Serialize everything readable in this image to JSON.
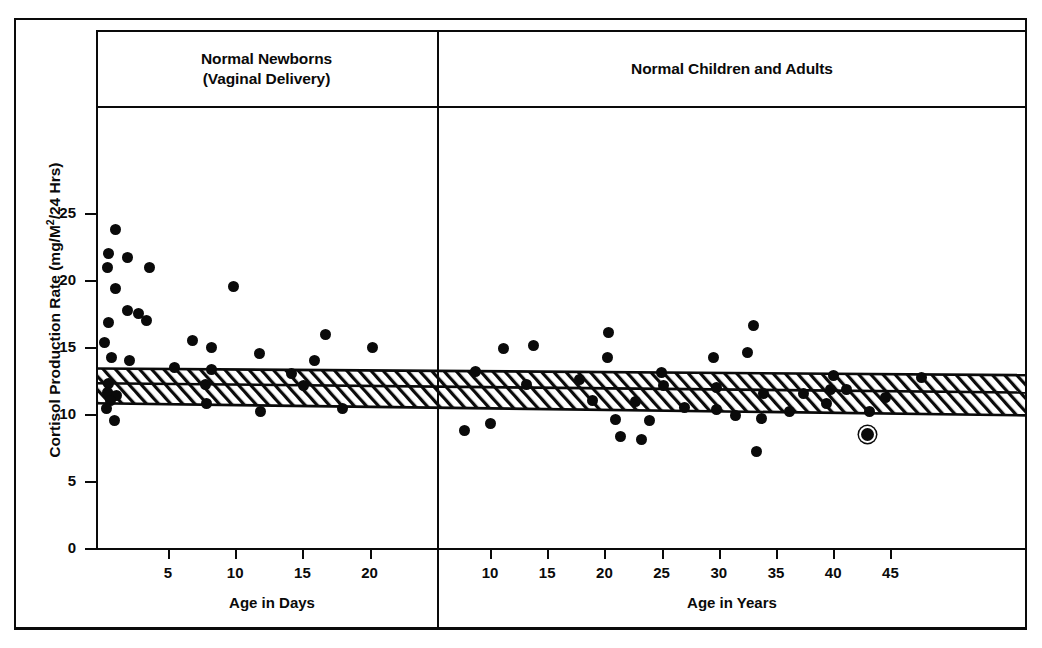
{
  "figure": {
    "y_axis_title_main": "Cortisol Production Rate (mg/M",
    "y_axis_title_sup": "2",
    "y_axis_title_tail": "/24 Hrs)"
  },
  "panels": {
    "left": {
      "title_line1": "Normal Newborns",
      "title_line2": "(Vaginal Delivery)",
      "x_axis_label": "Age in Days",
      "x_ticks": [
        5,
        10,
        15,
        20
      ]
    },
    "right": {
      "title": "Normal Children and Adults",
      "x_axis_label": "Age in Years",
      "x_ticks": [
        10,
        15,
        20,
        25,
        30,
        35,
        40,
        45
      ]
    }
  },
  "chart_data": {
    "type": "scatter",
    "ylabel": "Cortisol Production Rate (mg/M2/24 Hrs)",
    "ylim": [
      0,
      28
    ],
    "yticks": [
      0,
      5,
      10,
      15,
      20,
      25
    ],
    "grid": false,
    "legend": "none",
    "marker_color": "#0a0a0a",
    "panels": [
      {
        "name": "Normal Newborns (Vaginal Delivery)",
        "xlabel": "Age in Days",
        "xlim": [
          0,
          24
        ],
        "xticks": [
          5,
          10,
          15,
          20
        ],
        "points": [
          {
            "x": 1.1,
            "y": 23.8
          },
          {
            "x": 0.6,
            "y": 22.0
          },
          {
            "x": 0.5,
            "y": 20.9
          },
          {
            "x": 2.0,
            "y": 21.7
          },
          {
            "x": 3.6,
            "y": 20.9
          },
          {
            "x": 1.1,
            "y": 19.4
          },
          {
            "x": 9.9,
            "y": 19.5
          },
          {
            "x": 2.0,
            "y": 17.7
          },
          {
            "x": 2.8,
            "y": 17.5
          },
          {
            "x": 0.6,
            "y": 16.8
          },
          {
            "x": 3.4,
            "y": 17.0
          },
          {
            "x": 0.3,
            "y": 15.3
          },
          {
            "x": 6.8,
            "y": 15.5
          },
          {
            "x": 8.2,
            "y": 15.0
          },
          {
            "x": 16.7,
            "y": 15.9
          },
          {
            "x": 20.2,
            "y": 15.0
          },
          {
            "x": 0.8,
            "y": 14.2
          },
          {
            "x": 2.1,
            "y": 14.0
          },
          {
            "x": 11.8,
            "y": 14.5
          },
          {
            "x": 15.9,
            "y": 14.0
          },
          {
            "x": 5.5,
            "y": 13.5
          },
          {
            "x": 8.2,
            "y": 13.3
          },
          {
            "x": 14.2,
            "y": 13.0
          },
          {
            "x": 0.6,
            "y": 12.3
          },
          {
            "x": 7.8,
            "y": 12.2
          },
          {
            "x": 15.1,
            "y": 12.1
          },
          {
            "x": 0.5,
            "y": 11.6
          },
          {
            "x": 1.2,
            "y": 11.4
          },
          {
            "x": 0.7,
            "y": 11.0
          },
          {
            "x": 7.9,
            "y": 10.8
          },
          {
            "x": 0.4,
            "y": 10.4
          },
          {
            "x": 11.9,
            "y": 10.2
          },
          {
            "x": 18.0,
            "y": 10.4
          },
          {
            "x": 1.0,
            "y": 9.5
          }
        ]
      },
      {
        "name": "Normal Children and Adults",
        "xlabel": "Age in Years",
        "xlim": [
          5,
          48
        ],
        "xticks": [
          10,
          15,
          20,
          25,
          30,
          35,
          40,
          45
        ],
        "points": [
          {
            "x": 11.2,
            "y": 14.9
          },
          {
            "x": 13.8,
            "y": 15.1
          },
          {
            "x": 20.4,
            "y": 16.1
          },
          {
            "x": 33.0,
            "y": 16.6
          },
          {
            "x": 20.3,
            "y": 14.2
          },
          {
            "x": 29.5,
            "y": 14.2
          },
          {
            "x": 32.5,
            "y": 14.6
          },
          {
            "x": 8.7,
            "y": 13.2
          },
          {
            "x": 17.8,
            "y": 12.6
          },
          {
            "x": 25.0,
            "y": 13.1
          },
          {
            "x": 40.0,
            "y": 12.9
          },
          {
            "x": 47.7,
            "y": 12.7
          },
          {
            "x": 13.2,
            "y": 12.2
          },
          {
            "x": 25.2,
            "y": 12.1
          },
          {
            "x": 29.8,
            "y": 12.0
          },
          {
            "x": 39.8,
            "y": 11.8
          },
          {
            "x": 41.2,
            "y": 11.8
          },
          {
            "x": 19.0,
            "y": 11.0
          },
          {
            "x": 22.7,
            "y": 10.9
          },
          {
            "x": 27.0,
            "y": 10.5
          },
          {
            "x": 33.9,
            "y": 11.5
          },
          {
            "x": 37.4,
            "y": 11.5
          },
          {
            "x": 39.4,
            "y": 10.8
          },
          {
            "x": 44.6,
            "y": 11.2
          },
          {
            "x": 29.8,
            "y": 10.3
          },
          {
            "x": 31.5,
            "y": 9.9
          },
          {
            "x": 36.2,
            "y": 10.2
          },
          {
            "x": 43.2,
            "y": 10.2
          },
          {
            "x": 21.0,
            "y": 9.6
          },
          {
            "x": 23.9,
            "y": 9.5
          },
          {
            "x": 33.7,
            "y": 9.7
          },
          {
            "x": 7.8,
            "y": 8.8
          },
          {
            "x": 10.0,
            "y": 9.3
          },
          {
            "x": 21.4,
            "y": 8.3
          },
          {
            "x": 23.2,
            "y": 8.1
          },
          {
            "x": 33.3,
            "y": 7.2
          },
          {
            "x": 43.0,
            "y": 8.5,
            "ringed": true
          }
        ]
      }
    ],
    "reference_band": {
      "description": "Hatched normal range band with mean line, spanning both panels, slightly declining with age",
      "left_top": 13.4,
      "left_mean": 12.3,
      "left_bottom": 10.8,
      "right_top": 12.9,
      "right_mean": 11.6,
      "right_bottom": 9.9
    }
  }
}
